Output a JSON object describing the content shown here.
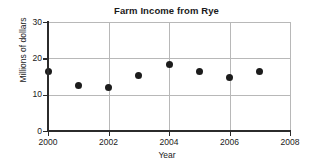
{
  "chart_data": {
    "type": "scatter",
    "title": "Farm Income from Rye",
    "xlabel": "Year",
    "ylabel": "Millions of dollars",
    "x": [
      2000,
      2001,
      2002,
      2003,
      2004,
      2005,
      2006,
      2007
    ],
    "values": [
      16.4,
      12.4,
      12.0,
      15.3,
      18.3,
      16.5,
      14.7,
      16.5
    ],
    "series": [
      {
        "name": "Farm income from rye",
        "points": [
          {
            "x": 2000,
            "y": 16.4
          },
          {
            "x": 2001,
            "y": 12.4
          },
          {
            "x": 2002,
            "y": 12.0
          },
          {
            "x": 2003,
            "y": 15.3
          },
          {
            "x": 2004,
            "y": 18.3
          },
          {
            "x": 2005,
            "y": 16.5
          },
          {
            "x": 2006,
            "y": 14.7
          },
          {
            "x": 2007,
            "y": 16.5
          }
        ]
      }
    ],
    "xlim": [
      2000,
      2008
    ],
    "ylim": [
      0,
      30
    ],
    "xticks": [
      2000,
      2002,
      2004,
      2006,
      2008
    ],
    "yticks": [
      0,
      10,
      20,
      30
    ],
    "xtick_labels": [
      "2000",
      "2002",
      "2004",
      "2006",
      "2008"
    ],
    "ytick_labels": [
      "0",
      "10",
      "20",
      "30"
    ],
    "grid": true,
    "grid_axes": "both",
    "legend": false,
    "marker": "filled-circle",
    "marker_color": "#1c1c1c",
    "grid_color": "#b8b8b8",
    "axis_color": "#2b2b2b",
    "background_color": "#ffffff"
  }
}
